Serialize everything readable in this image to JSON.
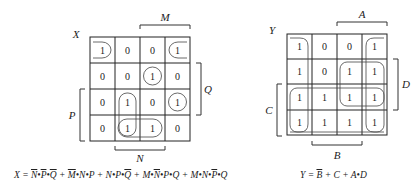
{
  "maps": [
    {
      "name": "X",
      "title": "X",
      "values": [
        [
          "1",
          "0",
          "0",
          "1"
        ],
        [
          "0",
          "0",
          "1",
          "0"
        ],
        [
          "0",
          "1",
          "0",
          "1"
        ],
        [
          "0",
          "1",
          "1",
          "0"
        ]
      ],
      "labels": {
        "top": "M",
        "right": "Q",
        "left": "P",
        "bottom": "N"
      }
    },
    {
      "name": "Y",
      "title": "Y",
      "values": [
        [
          "1",
          "0",
          "0",
          "1"
        ],
        [
          "1",
          "0",
          "1",
          "1"
        ],
        [
          "1",
          "1",
          "1",
          "1"
        ],
        [
          "1",
          "1",
          "1",
          "1"
        ]
      ],
      "labels": {
        "top": "A",
        "right": "D",
        "left": "C",
        "bottom": "B"
      }
    }
  ],
  "equations": {
    "x": {
      "lhs": "X =",
      "terms": [
        {
          "parts": [
            {
              "t": "N",
              "bar": true
            },
            {
              "t": "•"
            },
            {
              "t": "P",
              "bar": true
            },
            {
              "t": "•"
            },
            {
              "t": "Q",
              "bar": true
            }
          ]
        },
        {
          "parts": [
            {
              "t": "M",
              "bar": true
            },
            {
              "t": "•N•P"
            }
          ]
        },
        {
          "parts": [
            {
              "t": "N•P•"
            },
            {
              "t": "Q",
              "bar": true
            }
          ]
        },
        {
          "parts": [
            {
              "t": "M•"
            },
            {
              "t": "N",
              "bar": true
            },
            {
              "t": "•P•Q"
            }
          ]
        },
        {
          "parts": [
            {
              "t": "M•N•"
            },
            {
              "t": "P",
              "bar": true
            },
            {
              "t": "•Q"
            }
          ]
        }
      ],
      "plain": "X = N̄•P̄•Q̄ + M̄•N•P + N•P•Q̄ + M•N̄•P•Q + M•N•P̄•Q"
    },
    "y": {
      "lhs": "Y =",
      "plain": "Y = B̄ + C + A•D",
      "b": "B",
      "plus1": "+ C + A•D"
    }
  }
}
